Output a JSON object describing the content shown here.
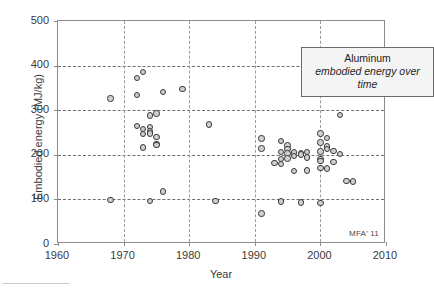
{
  "chart_data": {
    "type": "scatter",
    "title": "Aluminum",
    "subtitle": "embodied energy over time",
    "xlabel": "Year",
    "ylabel": "Embodied energy (MJ/kg)",
    "xlim": [
      1960,
      2010
    ],
    "ylim": [
      0,
      500
    ],
    "xticks": [
      1960,
      1970,
      1980,
      1990,
      2000,
      2010
    ],
    "yticks": [
      0,
      100,
      200,
      300,
      400,
      500
    ],
    "grid": true,
    "legend_position": "top-right",
    "marker": {
      "shape": "circle",
      "fill": "#cfcfcf",
      "edge": "#3a3a3a",
      "size_px": 6.4
    },
    "annotation": "MFA' 11",
    "series": [
      {
        "name": "Aluminum embodied energy",
        "points": [
          [
            1968,
            326
          ],
          [
            1968,
            98
          ],
          [
            1972,
            372
          ],
          [
            1972,
            334
          ],
          [
            1972,
            265
          ],
          [
            1973,
            385
          ],
          [
            1973,
            258
          ],
          [
            1973,
            246
          ],
          [
            1973,
            216
          ],
          [
            1974,
            288
          ],
          [
            1974,
            263
          ],
          [
            1974,
            252
          ],
          [
            1974,
            248
          ],
          [
            1974,
            96
          ],
          [
            1975,
            293
          ],
          [
            1975,
            240
          ],
          [
            1975,
            224
          ],
          [
            1975,
            222
          ],
          [
            1976,
            341
          ],
          [
            1976,
            118
          ],
          [
            1979,
            347
          ],
          [
            1983,
            268
          ],
          [
            1984,
            97
          ],
          [
            1991,
            237
          ],
          [
            1991,
            214
          ],
          [
            1991,
            68
          ],
          [
            1993,
            182
          ],
          [
            1994,
            231
          ],
          [
            1994,
            206
          ],
          [
            1994,
            190
          ],
          [
            1994,
            180
          ],
          [
            1994,
            95
          ],
          [
            1995,
            221
          ],
          [
            1995,
            213
          ],
          [
            1995,
            203
          ],
          [
            1995,
            192
          ],
          [
            1996,
            205
          ],
          [
            1996,
            198
          ],
          [
            1996,
            164
          ],
          [
            1997,
            204
          ],
          [
            1997,
            201
          ],
          [
            1997,
            93
          ],
          [
            1998,
            206
          ],
          [
            1998,
            194
          ],
          [
            1998,
            165
          ],
          [
            2000,
            248
          ],
          [
            2000,
            228
          ],
          [
            2000,
            207
          ],
          [
            2000,
            190
          ],
          [
            2000,
            186
          ],
          [
            2000,
            171
          ],
          [
            2000,
            92
          ],
          [
            2001,
            238
          ],
          [
            2001,
            219
          ],
          [
            2001,
            213
          ],
          [
            2001,
            169
          ],
          [
            2002,
            208
          ],
          [
            2002,
            184
          ],
          [
            2003,
            289
          ],
          [
            2003,
            202
          ],
          [
            2004,
            141
          ],
          [
            2005,
            140
          ]
        ]
      }
    ]
  },
  "axes": {
    "x_tick_labels": [
      "1960",
      "1970",
      "1980",
      "1990",
      "2000",
      "2010"
    ],
    "y_tick_labels": [
      "0",
      "100",
      "200",
      "300",
      "400",
      "500"
    ],
    "x_axis_title": "Year",
    "y_axis_title": "Embodied energy (MJ/kg)"
  },
  "legend": {
    "title": "Aluminum",
    "subtitle": "embodied energy over time"
  },
  "credit": {
    "text": "MFA' 11"
  }
}
